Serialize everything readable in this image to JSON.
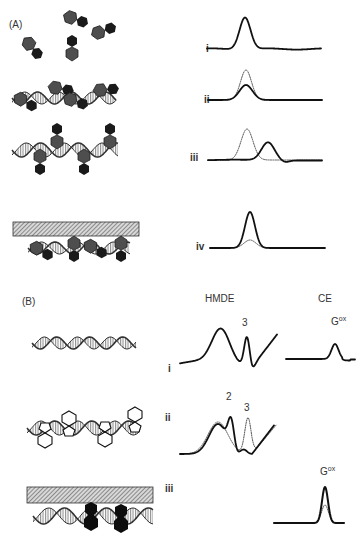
{
  "figure": {
    "panel_a": {
      "label": "(A)",
      "rows": [
        {
          "roman": "i",
          "scene": "free-intercalator-molecules",
          "traces": [
            "solid"
          ]
        },
        {
          "roman": "ii",
          "scene": "intercalators-bound-to-dsdna-in-solution",
          "traces": [
            "solid",
            "dotted"
          ]
        },
        {
          "roman": "iii",
          "scene": "groove-binders-on-dsdna",
          "traces": [
            "solid",
            "dotted"
          ]
        },
        {
          "roman": "iv",
          "scene": "dsdna-with-binders-on-electrode-surface",
          "traces": [
            "solid",
            "dotted"
          ]
        }
      ]
    },
    "panel_b": {
      "label": "(B)",
      "columns": [
        "HMDE",
        "CE"
      ],
      "rows": [
        {
          "roman": "i",
          "scene": "bare-dsdna",
          "hmde_peak_labels": [
            "3"
          ],
          "ce_peak_label": "G",
          "ce_peak_sup": "ox"
        },
        {
          "roman": "ii",
          "scene": "dsdna-with-outline-intercalators",
          "hmde_peak_labels": [
            "2",
            "3"
          ]
        },
        {
          "roman": "iii",
          "scene": "dsdna-with-binders-on-electrode-surface",
          "ce_peak_label": "G",
          "ce_peak_sup": "ox"
        }
      ]
    }
  },
  "colors": {
    "line": "#111111",
    "molecule_fill": "#555555",
    "molecule_dark": "#151515",
    "electrode_hatch": "#666666"
  }
}
